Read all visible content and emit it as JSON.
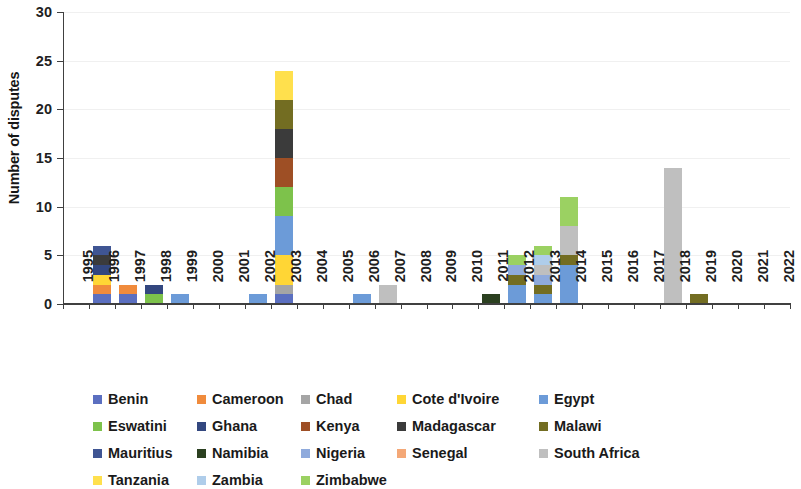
{
  "chart_data": {
    "type": "bar",
    "subtype": "stacked-bar",
    "title": "",
    "xlabel": "",
    "ylabel": "Number of disputes",
    "ylim": [
      0,
      30
    ],
    "yticks": [
      0,
      5,
      10,
      15,
      20,
      25,
      30
    ],
    "grid": true,
    "grid_axis": "y",
    "legend_position": "bottom",
    "legend_columns": 5,
    "categories": [
      "1995",
      "1996",
      "1997",
      "1998",
      "1999",
      "2000",
      "2001",
      "2002",
      "2003",
      "2004",
      "2005",
      "2006",
      "2007",
      "2008",
      "2009",
      "2010",
      "2011",
      "2012",
      "2013",
      "2014",
      "2015",
      "2016",
      "2017",
      "2018",
      "2019",
      "2020",
      "2021",
      "2022"
    ],
    "series": [
      {
        "name": "Benin",
        "color": "#5B6FC0",
        "values": [
          0,
          1,
          1,
          0,
          0,
          0,
          0,
          0,
          1,
          0,
          0,
          0,
          0,
          0,
          0,
          0,
          0,
          0,
          0,
          0,
          0,
          0,
          0,
          0,
          0,
          0,
          0,
          0
        ]
      },
      {
        "name": "Cameroon",
        "color": "#F08B3C",
        "values": [
          0,
          1,
          1,
          0,
          0,
          0,
          0,
          0,
          0,
          0,
          0,
          0,
          0,
          0,
          0,
          0,
          0,
          0,
          0,
          0,
          0,
          0,
          0,
          0,
          0,
          0,
          0,
          0
        ]
      },
      {
        "name": "Chad",
        "color": "#A5A5A5",
        "values": [
          0,
          0,
          0,
          0,
          0,
          0,
          0,
          0,
          1,
          0,
          0,
          0,
          0,
          0,
          0,
          0,
          0,
          0,
          0,
          0,
          0,
          0,
          0,
          0,
          0,
          0,
          0,
          0
        ]
      },
      {
        "name": "Cote d'Ivoire",
        "color": "#FFD635",
        "values": [
          0,
          1,
          0,
          0,
          0,
          0,
          0,
          0,
          3,
          0,
          0,
          0,
          0,
          0,
          0,
          0,
          0,
          0,
          0,
          0,
          0,
          0,
          0,
          0,
          0,
          0,
          0,
          0
        ]
      },
      {
        "name": "Egypt",
        "color": "#6C9BD8",
        "values": [
          0,
          0,
          0,
          0,
          1,
          0,
          0,
          1,
          4,
          0,
          0,
          1,
          0,
          0,
          0,
          0,
          0,
          2,
          1,
          4,
          0,
          0,
          0,
          0,
          0,
          0,
          0,
          0
        ]
      },
      {
        "name": "Eswatini",
        "color": "#7DC24B",
        "values": [
          0,
          0,
          0,
          1,
          0,
          0,
          0,
          0,
          3,
          0,
          0,
          0,
          0,
          0,
          0,
          0,
          0,
          0,
          0,
          0,
          0,
          0,
          0,
          0,
          0,
          0,
          0,
          0
        ]
      },
      {
        "name": "Ghana",
        "color": "#33477F",
        "values": [
          0,
          1,
          0,
          1,
          0,
          0,
          0,
          0,
          0,
          0,
          0,
          0,
          0,
          0,
          0,
          0,
          0,
          0,
          0,
          0,
          0,
          0,
          0,
          0,
          0,
          0,
          0,
          0
        ]
      },
      {
        "name": "Kenya",
        "color": "#9E4F25",
        "values": [
          0,
          0,
          0,
          0,
          0,
          0,
          0,
          0,
          3,
          0,
          0,
          0,
          0,
          0,
          0,
          0,
          0,
          0,
          0,
          0,
          0,
          0,
          0,
          0,
          0,
          0,
          0,
          0
        ]
      },
      {
        "name": "Madagascar",
        "color": "#3B3B3B",
        "values": [
          0,
          1,
          0,
          0,
          0,
          0,
          0,
          0,
          3,
          0,
          0,
          0,
          0,
          0,
          0,
          0,
          0,
          0,
          0,
          0,
          0,
          0,
          0,
          0,
          0,
          0,
          0,
          0
        ]
      },
      {
        "name": "Malawi",
        "color": "#736D22",
        "values": [
          0,
          0,
          0,
          0,
          0,
          0,
          0,
          0,
          3,
          0,
          0,
          0,
          0,
          0,
          0,
          0,
          0,
          1,
          1,
          1,
          0,
          0,
          0,
          0,
          1,
          0,
          0,
          0
        ]
      },
      {
        "name": "Mauritius",
        "color": "#3F5593",
        "values": [
          0,
          1,
          0,
          0,
          0,
          0,
          0,
          0,
          0,
          0,
          0,
          0,
          0,
          0,
          0,
          0,
          0,
          0,
          0,
          0,
          0,
          0,
          0,
          0,
          0,
          0,
          0,
          0
        ]
      },
      {
        "name": "Namibia",
        "color": "#2B4020",
        "values": [
          0,
          0,
          0,
          0,
          0,
          0,
          0,
          0,
          0,
          0,
          0,
          0,
          0,
          0,
          0,
          0,
          1,
          0,
          0,
          0,
          0,
          0,
          0,
          0,
          0,
          0,
          0,
          0
        ]
      },
      {
        "name": "Nigeria",
        "color": "#8FAADC",
        "values": [
          0,
          0,
          0,
          0,
          0,
          0,
          0,
          0,
          0,
          0,
          0,
          0,
          0,
          0,
          0,
          0,
          0,
          1,
          1,
          0,
          0,
          0,
          0,
          0,
          0,
          0,
          0,
          0
        ]
      },
      {
        "name": "Senegal",
        "color": "#F4A877",
        "values": [
          0,
          0,
          0,
          0,
          0,
          0,
          0,
          0,
          0,
          0,
          0,
          0,
          0,
          0,
          0,
          0,
          0,
          0,
          0,
          0,
          0,
          0,
          0,
          0,
          0,
          0,
          0,
          0
        ]
      },
      {
        "name": "South Africa",
        "color": "#BFBFBF",
        "values": [
          0,
          0,
          0,
          0,
          0,
          0,
          0,
          0,
          0,
          0,
          0,
          0,
          2,
          0,
          0,
          0,
          0,
          0,
          1,
          3,
          0,
          0,
          0,
          14,
          0,
          0,
          0,
          0
        ]
      },
      {
        "name": "Tanzania",
        "color": "#FFE04D",
        "values": [
          0,
          0,
          0,
          0,
          0,
          0,
          0,
          0,
          3,
          0,
          0,
          0,
          0,
          0,
          0,
          0,
          0,
          0,
          0,
          0,
          0,
          0,
          0,
          0,
          0,
          0,
          0,
          0
        ]
      },
      {
        "name": "Zambia",
        "color": "#AFCDEA",
        "values": [
          0,
          0,
          0,
          0,
          0,
          0,
          0,
          0,
          0,
          0,
          0,
          0,
          0,
          0,
          0,
          0,
          0,
          0,
          1,
          0,
          0,
          0,
          0,
          0,
          0,
          0,
          0,
          0
        ]
      },
      {
        "name": "Zimbabwe",
        "color": "#9BD162",
        "values": [
          0,
          0,
          0,
          0,
          0,
          0,
          0,
          0,
          0,
          0,
          0,
          0,
          0,
          0,
          0,
          0,
          0,
          1,
          1,
          3,
          0,
          0,
          0,
          0,
          0,
          0,
          0,
          0
        ]
      }
    ],
    "totals": [
      0,
      6,
      2,
      2,
      1,
      0,
      0,
      1,
      24,
      0,
      0,
      1,
      2,
      0,
      0,
      0,
      1,
      5,
      5,
      11,
      0,
      0,
      0,
      14,
      1,
      0,
      0,
      0
    ]
  },
  "axis": {
    "y_title": "Number of disputes"
  }
}
